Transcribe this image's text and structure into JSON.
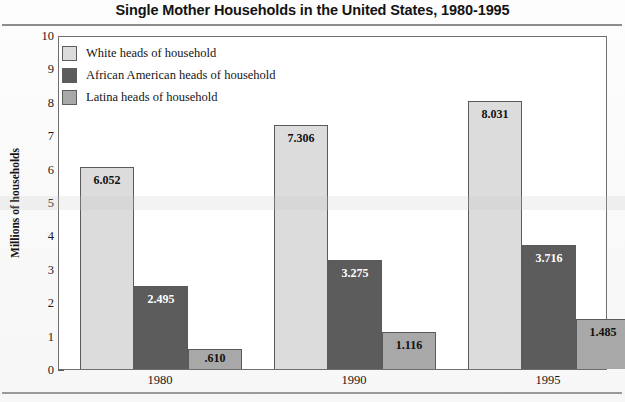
{
  "chart_data": {
    "type": "bar",
    "title": "Single Mother Households in the United States, 1980-1995",
    "xlabel": "",
    "ylabel": "Millions of households",
    "categories": [
      "1980",
      "1990",
      "1995"
    ],
    "ylim": [
      0,
      10
    ],
    "ytick_labels": [
      "0",
      "1",
      "2",
      "3",
      "4",
      "5",
      "6",
      "7",
      "8",
      "9",
      "10"
    ],
    "grid": false,
    "legend_position": "top-left inside plot",
    "series": [
      {
        "name": "White heads of household",
        "color": "#dcdcdc",
        "label_color": "#111111",
        "values": [
          6.052,
          7.306,
          8.031
        ],
        "value_labels": [
          "6.052",
          "7.306",
          "8.031"
        ]
      },
      {
        "name": "African American heads of household",
        "color": "#5c5c5c",
        "label_color": "#ffffff",
        "values": [
          2.495,
          3.275,
          3.716
        ],
        "value_labels": [
          "2.495",
          "3.275",
          "3.716"
        ]
      },
      {
        "name": "Latina heads of household",
        "color": "#a8a8a8",
        "label_color": "#111111",
        "values": [
          0.61,
          1.116,
          1.485
        ],
        "value_labels": [
          ".610",
          "1.116",
          "1.485"
        ]
      }
    ]
  },
  "legend": {
    "items": [
      {
        "label": "White heads of household",
        "color": "#dcdcdc"
      },
      {
        "label": "African American heads of household",
        "color": "#5c5c5c"
      },
      {
        "label": "Latina heads of household",
        "color": "#a8a8a8"
      }
    ]
  },
  "colors": {
    "frame": "#6f6f6f",
    "rule": "#8d8d8d",
    "text": "#131313",
    "white_bar": "#dcdcdc",
    "african_american_bar": "#5c5c5c",
    "latina_bar": "#a8a8a8"
  }
}
